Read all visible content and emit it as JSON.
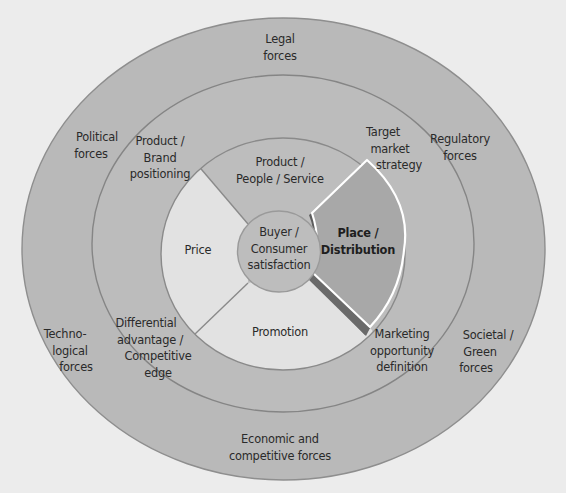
{
  "diagram": {
    "type": "concentric-marketing-environment",
    "colors": {
      "background": "#ececec",
      "outer_ring": "#b9b9b9",
      "middle_ring": "#bcbcbc",
      "inner_product_segment": "#bdbdbd",
      "inner_light_segments": "#e2e2e2",
      "center_circle": "#bdbdbd",
      "highlight_wedge": "#a8a8a8",
      "ring_stroke": "#8a8a8a",
      "text": "#2a2a2a"
    },
    "center": {
      "lines": [
        "Buyer /",
        "Consumer",
        "satisfaction"
      ]
    },
    "marketing_mix": [
      {
        "id": "product",
        "lines": [
          "Product /",
          "People / Service"
        ],
        "highlighted": false
      },
      {
        "id": "price",
        "lines": [
          "Price"
        ],
        "highlighted": false
      },
      {
        "id": "promotion",
        "lines": [
          "Promotion"
        ],
        "highlighted": false
      },
      {
        "id": "place",
        "lines": [
          "Place /",
          "Distribution"
        ],
        "highlighted": true
      }
    ],
    "strategy_ring": [
      {
        "id": "product-brand-positioning",
        "lines": [
          "Product /",
          "Brand",
          "positioning"
        ]
      },
      {
        "id": "target-market-strategy",
        "lines": [
          "Target",
          "market",
          "strategy"
        ]
      },
      {
        "id": "differential-advantage",
        "lines": [
          "Differential",
          "advantage /",
          "Competitive",
          "edge"
        ]
      },
      {
        "id": "marketing-opportunity",
        "lines": [
          "Marketing",
          "opportunity",
          "definition"
        ]
      }
    ],
    "forces_ring": [
      {
        "id": "legal",
        "lines": [
          "Legal",
          "forces"
        ]
      },
      {
        "id": "political",
        "lines": [
          "Political",
          "forces"
        ]
      },
      {
        "id": "regulatory",
        "lines": [
          "Regulatory",
          "forces"
        ]
      },
      {
        "id": "technological",
        "lines": [
          "Techno-",
          "logical",
          "forces"
        ]
      },
      {
        "id": "societal-green",
        "lines": [
          "Societal /",
          "Green",
          "forces"
        ]
      },
      {
        "id": "economic-competitive",
        "lines": [
          "Economic and",
          "competitive forces"
        ]
      }
    ]
  }
}
